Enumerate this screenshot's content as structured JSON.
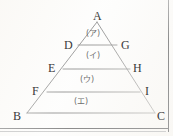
{
  "figure": {
    "kind": "geometry-diagram",
    "shape": "triangle",
    "stroke_color": "#6b6b6b",
    "label_color": "#3a3a3a",
    "region_label_color": "#6d6d6d",
    "background_color": "#fdfdfc"
  },
  "vertices": [
    {
      "name": "A",
      "label": "A",
      "x": 97,
      "y": 22,
      "label_x": 93,
      "label_y": 10
    },
    {
      "name": "D",
      "label": "D",
      "x": 78,
      "y": 45,
      "label_x": 64,
      "label_y": 39
    },
    {
      "name": "G",
      "label": "G",
      "x": 117,
      "y": 45,
      "label_x": 121,
      "label_y": 39
    },
    {
      "name": "E",
      "label": "E",
      "x": 63,
      "y": 69,
      "label_x": 48,
      "label_y": 62
    },
    {
      "name": "H",
      "label": "H",
      "x": 130,
      "y": 69,
      "label_x": 133,
      "label_y": 62
    },
    {
      "name": "F",
      "label": "F",
      "x": 47,
      "y": 92,
      "label_x": 32,
      "label_y": 85
    },
    {
      "name": "I",
      "label": "I",
      "x": 140,
      "y": 92,
      "label_x": 145,
      "label_y": 85
    },
    {
      "name": "B",
      "label": "B",
      "x": 27,
      "y": 113,
      "label_x": 13,
      "label_y": 110
    },
    {
      "name": "C",
      "label": "C",
      "x": 155,
      "y": 113,
      "label_x": 157,
      "label_y": 110
    }
  ],
  "segments": [
    {
      "name": "side-AB",
      "from": "A",
      "to": "B"
    },
    {
      "name": "side-AC",
      "from": "A",
      "to": "C"
    },
    {
      "name": "base-BC",
      "from": "B",
      "to": "C"
    },
    {
      "name": "line-DG",
      "from": "D",
      "to": "G"
    },
    {
      "name": "line-EH",
      "from": "E",
      "to": "H"
    },
    {
      "name": "line-FI",
      "from": "F",
      "to": "I"
    }
  ],
  "regions": [
    {
      "name": "region-a",
      "label": "(ア)",
      "x": 97,
      "y": 34
    },
    {
      "name": "region-i",
      "label": "(イ)",
      "x": 97,
      "y": 56
    },
    {
      "name": "region-u",
      "label": "(ウ)",
      "x": 90,
      "y": 80
    },
    {
      "name": "region-e",
      "label": "(エ)",
      "x": 82,
      "y": 102
    }
  ]
}
